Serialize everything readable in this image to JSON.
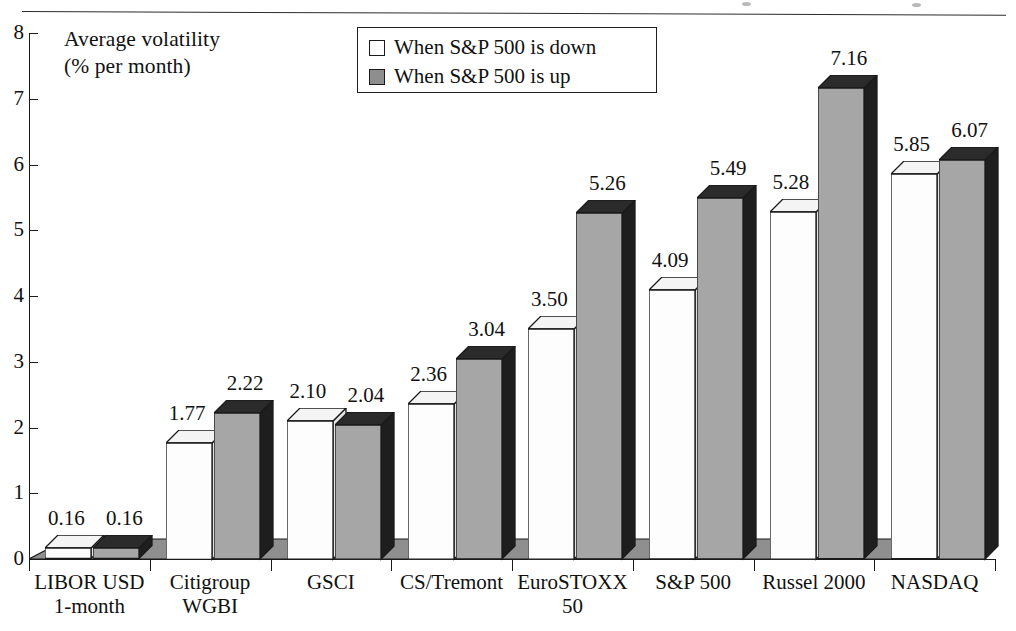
{
  "chart_data": {
    "type": "bar",
    "title": "",
    "axis_title_line1": "Average volatility",
    "axis_title_line2": "(% per month)",
    "xlabel": "",
    "ylabel": "Average volatility (% per month)",
    "ylim": [
      0,
      8
    ],
    "yticks": [
      0,
      1,
      2,
      3,
      4,
      5,
      6,
      7,
      8
    ],
    "ytick_labels": [
      "0",
      "1",
      "2",
      "3",
      "4",
      "5",
      "6",
      "7",
      "8"
    ],
    "grid": false,
    "legend_position": "top-center",
    "three_d": true,
    "categories": [
      "LIBOR USD 1-month",
      "Citigroup WGBI",
      "GSCI",
      "CS/Tremont",
      "EuroSTOXX 50",
      "S&P 500",
      "Russel 2000",
      "NASDAQ"
    ],
    "category_lines": [
      [
        "LIBOR USD",
        "1-month"
      ],
      [
        "Citigroup",
        "WGBI"
      ],
      [
        "GSCI",
        ""
      ],
      [
        "CS/Tremont",
        ""
      ],
      [
        "EuroSTOXX",
        "50"
      ],
      [
        "S&P 500",
        ""
      ],
      [
        "Russel 2000",
        ""
      ],
      [
        "NASDAQ",
        ""
      ]
    ],
    "series": [
      {
        "name": "When S&P 500 is down",
        "color": "#ffffff",
        "values": [
          0.16,
          1.77,
          2.1,
          2.36,
          3.5,
          4.09,
          5.28,
          5.85
        ],
        "labels": [
          "0.16",
          "1.77",
          "2.10",
          "2.36",
          "3.50",
          "4.09",
          "5.28",
          "5.85"
        ]
      },
      {
        "name": "When S&P 500 is up",
        "color": "#a6a6a6",
        "values": [
          0.16,
          2.22,
          2.04,
          3.04,
          5.26,
          5.49,
          7.16,
          6.07
        ],
        "labels": [
          "0.16",
          "2.22",
          "2.04",
          "3.04",
          "5.26",
          "5.49",
          "7.16",
          "6.07"
        ]
      }
    ]
  },
  "legend": {
    "items": [
      {
        "label": "When S&P 500 is down",
        "swatch": "white"
      },
      {
        "label": "When S&P 500 is up",
        "swatch": "gray"
      }
    ]
  },
  "colors": {
    "series_down": "#ffffff",
    "series_up": "#a6a6a6",
    "series_up_side": "#1e1e1e",
    "floor": "#8f8f8f",
    "axis": "#1a1a1a",
    "text": "#111111"
  }
}
